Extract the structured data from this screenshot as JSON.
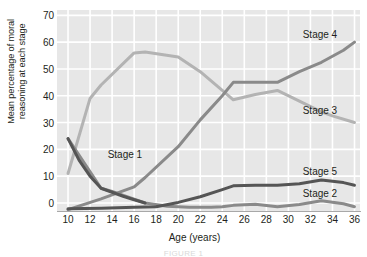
{
  "figure": {
    "caption_partial": "FIGURE 1"
  },
  "chart_data": {
    "type": "line",
    "title": "",
    "xlabel": "Age (years)",
    "ylabel": "Mean percentage of moral reasoning at each stage",
    "ylabel_line1": "Mean percentage of moral",
    "ylabel_line2": "reasoning at each stage",
    "xlim": [
      9,
      36.5
    ],
    "ylim": [
      -3,
      72
    ],
    "xticks": [
      10,
      12,
      14,
      16,
      18,
      20,
      22,
      24,
      26,
      28,
      30,
      32,
      34,
      36
    ],
    "yticks": [
      0,
      10,
      20,
      30,
      40,
      50,
      60,
      70
    ],
    "grid": true,
    "grid_color": "#ffffff",
    "plot_background": "#e7e7e7",
    "legend": "inline-labels",
    "series": [
      {
        "name": "Stage 1",
        "color": "#555555",
        "label_x": 13.6,
        "label_y": 18.0,
        "x": [
          10,
          11,
          12,
          13,
          14,
          15,
          16,
          17
        ],
        "y": [
          24,
          16,
          10,
          5.5,
          4,
          2.5,
          1.2,
          0
        ]
      },
      {
        "name": "Stage 2",
        "color": "#555555",
        "label_x": 31.3,
        "label_y": 3.4,
        "x": [
          10,
          13,
          16,
          18,
          20,
          22,
          24,
          25,
          27,
          29,
          31,
          33,
          35,
          36
        ],
        "y": [
          -2.2,
          -2.0,
          -1.6,
          -1.4,
          0.2,
          2.3,
          5.0,
          6.4,
          6.6,
          6.6,
          7.2,
          8.6,
          7.6,
          6.6
        ]
      },
      {
        "name": "Stage 3",
        "color": "#b3b3b3",
        "label_x": 31.3,
        "label_y": 34.5,
        "x": [
          10,
          12,
          13,
          16,
          17,
          20,
          22,
          24,
          25,
          27,
          29,
          31,
          33,
          34,
          36
        ],
        "y": [
          11,
          39,
          44,
          56,
          56.3,
          54.5,
          49,
          42,
          38.5,
          40.5,
          42,
          38,
          34,
          32.5,
          30
        ]
      },
      {
        "name": "Stage 4",
        "color": "#8a8a8a",
        "label_x": 31.3,
        "label_y": 62.5,
        "x": [
          10,
          13,
          16,
          17,
          20,
          22,
          24,
          25,
          27,
          29,
          31,
          33,
          35,
          36
        ],
        "y": [
          -2.5,
          1.5,
          6.0,
          9.5,
          21,
          31,
          40,
          45,
          45,
          45,
          49,
          52.5,
          57,
          60
        ]
      },
      {
        "name": "Stage 5",
        "color": "#8a8a8a",
        "label_x": 31.3,
        "label_y": 11.5,
        "x": [
          10,
          13,
          14,
          16,
          17,
          19,
          21,
          23,
          24,
          25,
          27,
          29,
          31,
          33,
          35,
          36
        ],
        "y": [
          24,
          5.5,
          4.3,
          1.4,
          0,
          -1.2,
          -1.6,
          -1.6,
          -1.4,
          -0.9,
          -0.5,
          -1.4,
          -0.6,
          0.8,
          -0.3,
          -1.4
        ]
      }
    ],
    "series_labels": [
      {
        "name": "Stage 1",
        "text": "Stage 1"
      },
      {
        "name": "Stage 2",
        "text": "Stage 2"
      },
      {
        "name": "Stage 3",
        "text": "Stage 3"
      },
      {
        "name": "Stage 4",
        "text": "Stage 4"
      },
      {
        "name": "Stage 5",
        "text": "Stage 5"
      }
    ]
  }
}
